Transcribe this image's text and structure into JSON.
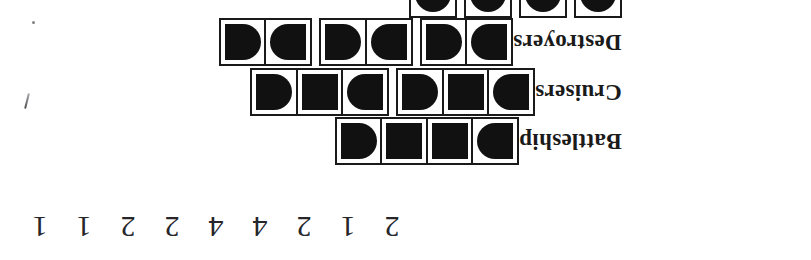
{
  "document": {
    "kind": "battleship-puzzle-fleet-legend",
    "orientation": "rotated-180",
    "page_background": "#ffffff",
    "ink_color": "#111111"
  },
  "fleet": {
    "rows": [
      {
        "id": "submarines",
        "label": "",
        "ship_length": 1,
        "ship_count": 4,
        "clipped_at_top": true,
        "ships": [
          {
            "cells": [
              "sub"
            ]
          },
          {
            "cells": [
              "sub"
            ]
          },
          {
            "cells": [
              "sub"
            ]
          },
          {
            "cells": [
              "sub"
            ]
          }
        ]
      },
      {
        "id": "destroyers",
        "label": "Destroyers",
        "ship_length": 2,
        "ship_count": 3,
        "clipped_at_top": false,
        "ships": [
          {
            "cells": [
              "endL",
              "endR"
            ]
          },
          {
            "cells": [
              "endL",
              "endR"
            ]
          },
          {
            "cells": [
              "endL",
              "endR"
            ]
          }
        ]
      },
      {
        "id": "cruisers",
        "label": "Cruisers",
        "ship_length": 3,
        "ship_count": 2,
        "clipped_at_top": false,
        "ships": [
          {
            "cells": [
              "endL",
              "sq",
              "endR"
            ]
          },
          {
            "cells": [
              "endL",
              "sq",
              "endR"
            ]
          }
        ]
      },
      {
        "id": "battleship",
        "label": "Battleship",
        "ship_length": 4,
        "ship_count": 1,
        "clipped_at_top": false,
        "ships": [
          {
            "cells": [
              "endL",
              "sq",
              "sq",
              "endR"
            ]
          }
        ]
      }
    ]
  },
  "column_clues": {
    "caption": "",
    "values": [
      2,
      1,
      2,
      4,
      4,
      2,
      2,
      1,
      1
    ],
    "count": 9
  },
  "artifacts": {
    "speck_dot": "·",
    "speck_stroke": ""
  }
}
